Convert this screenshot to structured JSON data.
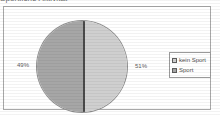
{
  "title": {
    "text": "Sportliche Aktivität"
  },
  "chart_data": {
    "type": "pie",
    "title": "Sportliche Aktivität",
    "categories": [
      "kein Sport",
      "Sport"
    ],
    "values": [
      51,
      49
    ],
    "value_labels": [
      "51%",
      "49%"
    ],
    "colors": [
      "#cfcfcf",
      "#a6a6a6"
    ],
    "legend_position": "right",
    "grid": false,
    "xlabel": "",
    "ylabel": ""
  },
  "labels": {
    "left_pct": "49%",
    "right_pct": "51%"
  },
  "legend": {
    "entries": [
      {
        "label": "kein Sport",
        "color": "#cfcfcf"
      },
      {
        "label": "Sport",
        "color": "#a6a6a6"
      }
    ]
  },
  "colors": {
    "slice_light": "#cfcfcf",
    "slice_dark": "#a6a6a6",
    "frame": "#a8a8a8",
    "text": "#4f4f4f"
  }
}
